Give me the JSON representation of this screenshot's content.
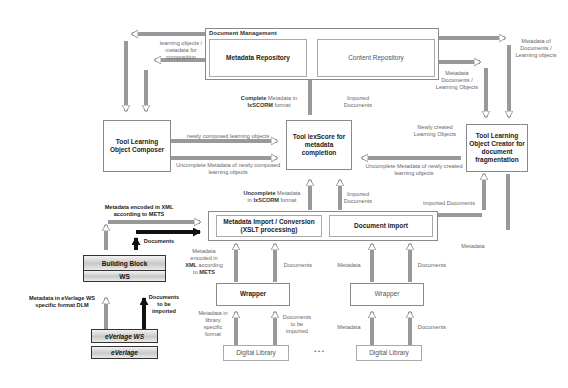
{
  "document_management": {
    "title": "Document Management",
    "metadata_repository": "Metadata Repository",
    "content_repository": "Content Repository"
  },
  "tools": {
    "composer": "Tool Learning Object Composer",
    "lexscore": "Tool lexScore for metadata completion",
    "creator": "Tool Learning Object Creator for document fragmentation"
  },
  "import": {
    "metadata_conversion": "Metadata Import / Conversion (XSLT processing)",
    "document_import": "Document import"
  },
  "wrappers": [
    {
      "label": "Wrapper"
    },
    {
      "label": "Wrapper"
    }
  ],
  "libraries": [
    {
      "label": "Digital Library"
    },
    {
      "label": "Digital Library"
    }
  ],
  "ellipsis": "•    •    •",
  "everlage": {
    "building_block": "Building Block",
    "ws": "WS",
    "everlage_ws": "eVerlage WS",
    "everlage": "eVerlage"
  },
  "labels": {
    "learning_objects_metadata": "learning objects / metadata for composition",
    "metadata_of_documents": "Metadata of Documents / Learning objects",
    "metadata_documents_los": "Metadata Documents / Learning Objects",
    "complete_metadata_bold": "Complete",
    "complete_metadata_rest": " Metadata in",
    "complete_metadata_fmt_bold": "lxSCORM",
    "complete_metadata_fmt_rest": " format",
    "imported_documents_top": "Imported Documents",
    "newly_composed": "newly composed learning objects",
    "uncomplete_composed": "Uncomplete Metadata of newly composed learning objects",
    "newly_created": "Newly created Learning Objects",
    "uncomplete_created": "Uncomplete Metadata of newly created learning objects",
    "uncomplete_lxscorm_bold": "Uncomplete",
    "uncomplete_lxscorm_rest": " Metadata",
    "uncomplete_lxscorm_line2_pre": "in ",
    "uncomplete_lxscorm_line2_bold": "lxSCORM",
    "uncomplete_lxscorm_line2_post": " format",
    "imported_documents_mid": "Imported Documents",
    "imported_documents_right": "Imported Documents",
    "metadata_right": "Metadata",
    "metadata_xml_mets_top_line1": "Metadata encoded in XML",
    "metadata_xml_mets_top_line2": "according to METS",
    "documents_left": "Documents",
    "metadata_xml_mets_w1_a": "Metadata encoded in ",
    "metadata_xml_mets_w1_b": "XML",
    "metadata_xml_mets_w1_c": " according to ",
    "metadata_xml_mets_w1_d": "METS",
    "documents_w1": "Documents",
    "metadata_w2": "Metadata",
    "documents_w2": "Documents",
    "metadata_lib_specific": "Metadata in library specific format",
    "documents_to_be_imported_lib": "Documents to be imported",
    "metadata_lib2": "Metadata",
    "documents_lib2": "Documents",
    "metadata_everlage_format": "Metadata in eVerlage WS specific format DLM",
    "documents_to_be_imported_ev": "Documents to be imported"
  }
}
